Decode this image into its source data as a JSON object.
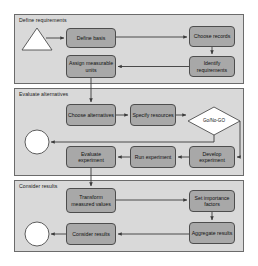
{
  "diagram": {
    "colors": {
      "lane_fill": "#d9d9d9",
      "lane_border": "#6b6b6b",
      "node_fill": "#a8a8a8",
      "node_border": "#4d4d4d",
      "edge": "#3a3a3a",
      "terminator_fill": "#ffffff",
      "decision_fill": "#cccccc",
      "page_background": "#ffffff"
    },
    "lanes": [
      {
        "id": "lane-define-requirements",
        "label": "Define requirements",
        "x": 14,
        "y": 14,
        "w": 230,
        "h": 70
      },
      {
        "id": "lane-evaluate-alternatives",
        "label": "Evaluate alternatives",
        "x": 14,
        "y": 88,
        "w": 230,
        "h": 88
      },
      {
        "id": "lane-consider-results",
        "label": "Consider results",
        "x": 14,
        "y": 180,
        "w": 230,
        "h": 72
      }
    ],
    "terminators": [
      {
        "id": "start-triangle",
        "shape": "triangle",
        "label": "",
        "x": 22,
        "y": 28,
        "w": 30,
        "h": 22
      },
      {
        "id": "end-circle-evaluate",
        "shape": "circle",
        "label": "",
        "cx": 37,
        "cy": 142,
        "r": 12
      },
      {
        "id": "end-circle-results",
        "shape": "circle",
        "label": "",
        "cx": 37,
        "cy": 234,
        "r": 12
      }
    ],
    "decisions": [
      {
        "id": "go-no-go",
        "label": "Go/No-GO",
        "cx": 214,
        "cy": 121,
        "rx": 26,
        "ry": 14
      }
    ],
    "nodes": [
      {
        "id": "define-basis",
        "label": "Define basis",
        "lane": "lane-define-requirements",
        "x": 66,
        "y": 28,
        "w": 50,
        "h": 20
      },
      {
        "id": "choose-records",
        "label": "Choose records",
        "lane": "lane-define-requirements",
        "x": 189,
        "y": 26,
        "w": 46,
        "h": 21
      },
      {
        "id": "identify-requirements",
        "label": "Identify requirements",
        "lane": "lane-define-requirements",
        "x": 189,
        "y": 56,
        "w": 46,
        "h": 21
      },
      {
        "id": "assign-measurable-units",
        "label": "Assign measurable units",
        "lane": "lane-define-requirements",
        "x": 66,
        "y": 55,
        "w": 50,
        "h": 23
      },
      {
        "id": "choose-alternatives",
        "label": "Choose alternatives",
        "lane": "lane-evaluate-alternatives",
        "x": 66,
        "y": 104,
        "w": 50,
        "h": 22
      },
      {
        "id": "specify-resources",
        "label": "Specify resources",
        "lane": "lane-evaluate-alternatives",
        "x": 130,
        "y": 104,
        "w": 46,
        "h": 22
      },
      {
        "id": "evaluate-experiment",
        "label": "Evaluate experiment",
        "lane": "lane-evaluate-alternatives",
        "x": 66,
        "y": 146,
        "w": 50,
        "h": 22
      },
      {
        "id": "run-experiment",
        "label": "Run experiment",
        "lane": "lane-evaluate-alternatives",
        "x": 130,
        "y": 146,
        "w": 46,
        "h": 22
      },
      {
        "id": "develop-experiment",
        "label": "Develop experiment",
        "lane": "lane-evaluate-alternatives",
        "x": 189,
        "y": 146,
        "w": 46,
        "h": 22
      },
      {
        "id": "transform-measured-values",
        "label": "Transform measured values",
        "lane": "lane-consider-results",
        "x": 66,
        "y": 188,
        "w": 50,
        "h": 25
      },
      {
        "id": "set-importance-factors",
        "label": "Set importance factors",
        "lane": "lane-consider-results",
        "x": 189,
        "y": 190,
        "w": 46,
        "h": 22
      },
      {
        "id": "aggregate-results",
        "label": "Aggregate results",
        "lane": "lane-consider-results",
        "x": 189,
        "y": 222,
        "w": 46,
        "h": 22
      },
      {
        "id": "consider-results",
        "label": "Consider results",
        "lane": "lane-consider-results",
        "x": 66,
        "y": 223,
        "w": 50,
        "h": 22
      }
    ],
    "edges": [
      {
        "from": "start-triangle",
        "to": "define-basis"
      },
      {
        "from": "define-basis",
        "to": "choose-records"
      },
      {
        "from": "choose-records",
        "to": "identify-requirements"
      },
      {
        "from": "identify-requirements",
        "to": "assign-measurable-units"
      },
      {
        "from": "assign-measurable-units",
        "to": "choose-alternatives"
      },
      {
        "from": "choose-alternatives",
        "to": "specify-resources"
      },
      {
        "from": "specify-resources",
        "to": "go-no-go"
      },
      {
        "from": "go-no-go",
        "to": "end-circle-evaluate"
      },
      {
        "from": "go-no-go",
        "to": "develop-experiment"
      },
      {
        "from": "develop-experiment",
        "to": "run-experiment"
      },
      {
        "from": "run-experiment",
        "to": "evaluate-experiment"
      },
      {
        "from": "evaluate-experiment",
        "to": "transform-measured-values"
      },
      {
        "from": "transform-measured-values",
        "to": "set-importance-factors"
      },
      {
        "from": "set-importance-factors",
        "to": "aggregate-results"
      },
      {
        "from": "aggregate-results",
        "to": "consider-results"
      },
      {
        "from": "consider-results",
        "to": "end-circle-results"
      }
    ]
  }
}
